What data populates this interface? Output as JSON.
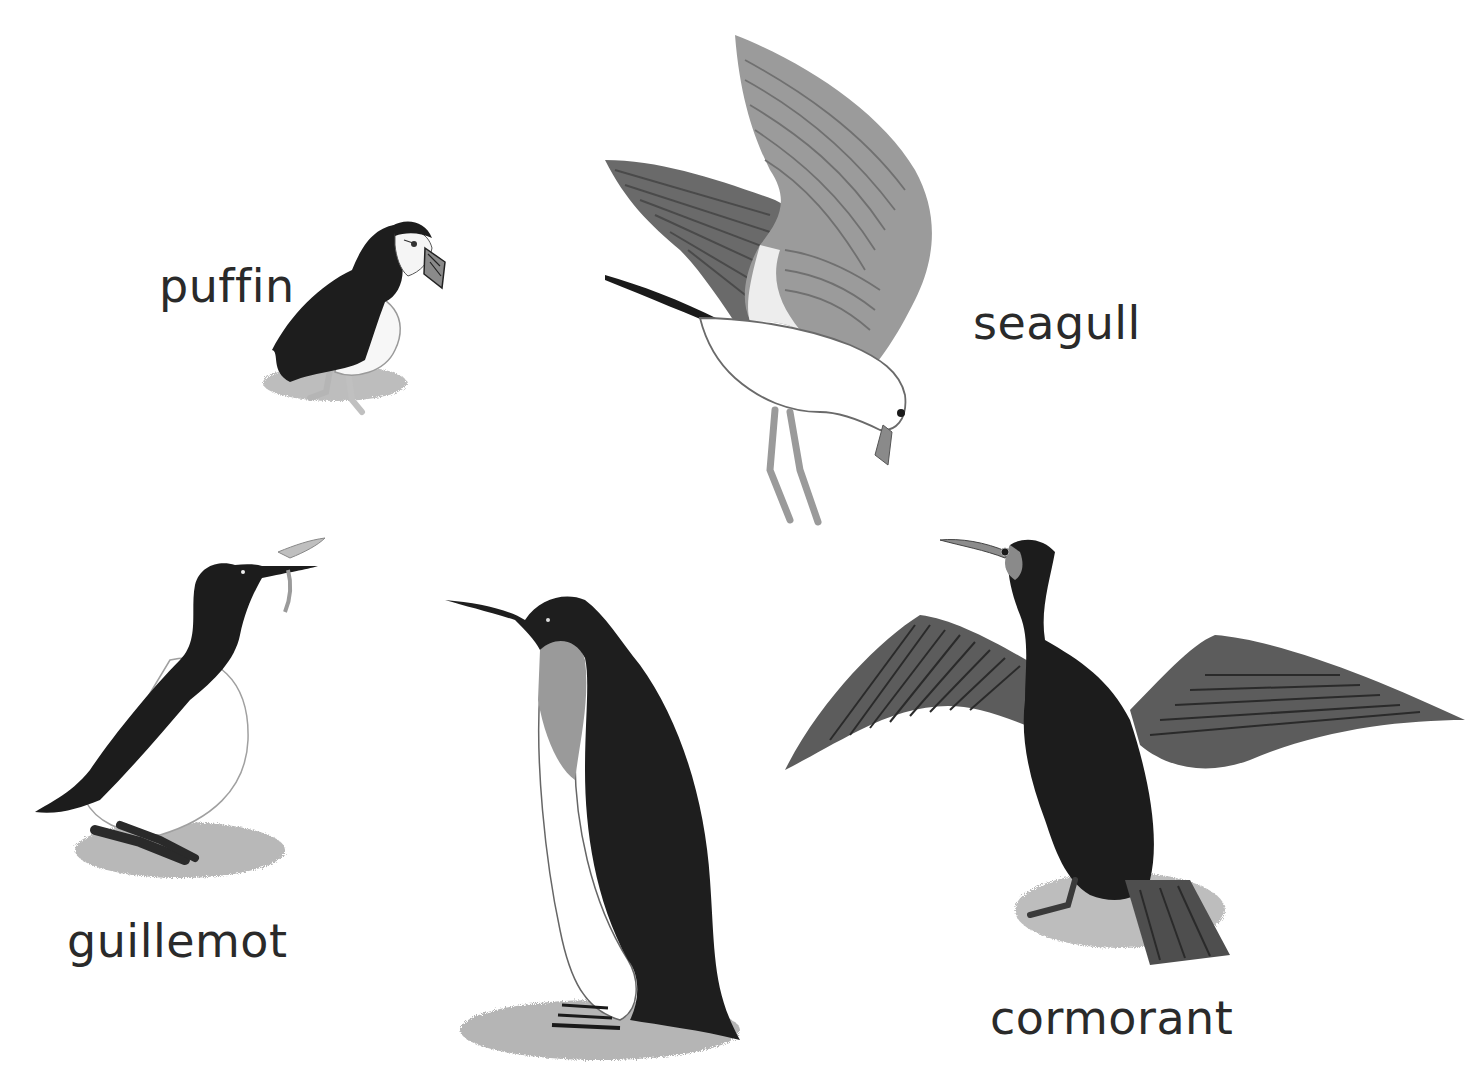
{
  "scene": {
    "description": "Illustration of seabirds",
    "background_color": "#ffffff",
    "text_color": "#2a2a2a"
  },
  "birds": [
    {
      "id": "puffin",
      "label": "puffin"
    },
    {
      "id": "seagull",
      "label": "seagull"
    },
    {
      "id": "guillemot",
      "label": "guillemot"
    },
    {
      "id": "penguin",
      "label": ""
    },
    {
      "id": "cormorant",
      "label": "cormorant"
    }
  ],
  "labels": {
    "puffin": "puffin",
    "seagull": "seagull",
    "guillemot": "guillemot",
    "cormorant": "cormorant"
  },
  "colors": {
    "black_plumage": "#1c1c1c",
    "dark_gray": "#3a3a3a",
    "mid_gray": "#7a7a7a",
    "light_gray": "#a8a8a8",
    "pale_gray": "#cfcfcf",
    "white": "#ffffff"
  }
}
